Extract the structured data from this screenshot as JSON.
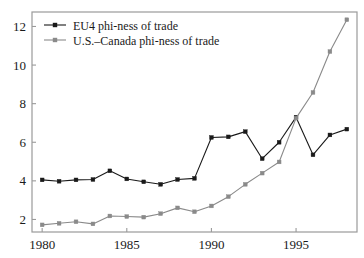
{
  "chart_data": {
    "type": "line",
    "title": "",
    "xlabel": "",
    "ylabel": "",
    "x": [
      1980,
      1981,
      1982,
      1983,
      1984,
      1985,
      1986,
      1987,
      1988,
      1989,
      1990,
      1991,
      1992,
      1993,
      1994,
      1995,
      1996,
      1997,
      1998
    ],
    "xlim": [
      1979.4,
      1998.6
    ],
    "ylim": [
      1.35,
      12.75
    ],
    "xticks": [
      1980,
      1985,
      1990,
      1995
    ],
    "xtick_labels": [
      "1980",
      "1985",
      "1990",
      "1995"
    ],
    "yticks": [
      2,
      4,
      6,
      8,
      10,
      12
    ],
    "ytick_labels": [
      "2",
      "4",
      "6",
      "8",
      "10",
      "12"
    ],
    "grid": false,
    "legend_position": "top-left",
    "series": [
      {
        "name": "EU4 phi-ness of trade",
        "color": "#1a1a1a",
        "marker": "square",
        "values": [
          4.05,
          3.98,
          4.05,
          4.07,
          4.52,
          4.1,
          3.95,
          3.82,
          4.07,
          4.13,
          6.25,
          6.28,
          6.55,
          5.15,
          6.0,
          7.3,
          5.35,
          6.38,
          6.68
        ]
      },
      {
        "name": "U.S.–Canada phi-ness of trade",
        "color": "#8a8a8a",
        "marker": "square",
        "values": [
          1.72,
          1.8,
          1.88,
          1.77,
          2.18,
          2.15,
          2.12,
          2.3,
          2.6,
          2.4,
          2.7,
          3.18,
          3.82,
          4.4,
          4.98,
          7.25,
          8.58,
          10.7,
          12.35
        ]
      }
    ]
  },
  "legend": {
    "entries": [
      {
        "label": "EU4 phi-ness of trade"
      },
      {
        "label": "U.S.–Canada phi-ness of trade"
      }
    ]
  },
  "axes": {
    "frame_color": "#9a9a9a"
  }
}
